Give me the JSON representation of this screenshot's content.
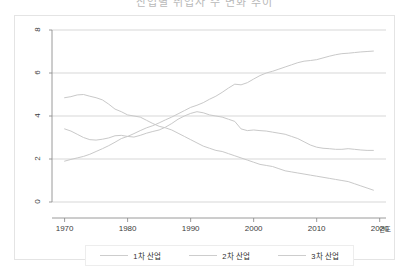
{
  "title": {
    "text": "산업별 취업자 수 변화 추이"
  },
  "axis": {
    "x_title": "연도",
    "x_ticks": [
      "1970",
      "1980",
      "1990",
      "2000",
      "2010",
      "2020"
    ],
    "y_ticks": [
      "0",
      "2",
      "4",
      "6",
      "8"
    ]
  },
  "legend": {
    "items": [
      {
        "label": "1차 산업",
        "color": "#cdcdcd"
      },
      {
        "label": "2차 산업",
        "color": "#cdcdcd"
      },
      {
        "label": "3차 산업",
        "color": "#cdcdcd"
      }
    ]
  },
  "colors": {
    "line": "#c9c9c9",
    "grid": "#d2d2d2",
    "axis": "#8f8f8f",
    "frame": "#e4e4e4",
    "text": "#3c3c3c"
  },
  "chart_data": {
    "type": "line",
    "title": "산업별 취업자 수 변화 추이",
    "xlabel": "연도",
    "ylabel": "",
    "xlim": [
      1968,
      2021
    ],
    "ylim": [
      0,
      8
    ],
    "grid": true,
    "legend_position": "bottom",
    "x": [
      1970,
      1971,
      1972,
      1973,
      1974,
      1975,
      1976,
      1977,
      1978,
      1979,
      1980,
      1981,
      1982,
      1983,
      1984,
      1985,
      1986,
      1987,
      1988,
      1989,
      1990,
      1991,
      1992,
      1993,
      1994,
      1995,
      1996,
      1997,
      1998,
      1999,
      2000,
      2001,
      2002,
      2003,
      2004,
      2005,
      2006,
      2007,
      2008,
      2009,
      2010,
      2011,
      2012,
      2013,
      2014,
      2015,
      2016,
      2017,
      2018,
      2019
    ],
    "series": [
      {
        "name": "1차 산업",
        "values": [
          4.85,
          4.9,
          4.98,
          5.0,
          4.92,
          4.85,
          4.75,
          4.55,
          4.32,
          4.2,
          4.05,
          4.0,
          3.95,
          3.8,
          3.65,
          3.52,
          3.45,
          3.35,
          3.2,
          3.05,
          2.9,
          2.75,
          2.6,
          2.5,
          2.4,
          2.35,
          2.25,
          2.15,
          2.05,
          1.95,
          1.85,
          1.75,
          1.7,
          1.65,
          1.55,
          1.45,
          1.4,
          1.35,
          1.3,
          1.25,
          1.2,
          1.15,
          1.1,
          1.05,
          1.0,
          0.95,
          0.85,
          0.75,
          0.65,
          0.55
        ]
      },
      {
        "name": "2차 산업",
        "values": [
          3.4,
          3.3,
          3.15,
          3.0,
          2.9,
          2.88,
          2.92,
          2.98,
          3.08,
          3.1,
          3.05,
          3.02,
          3.1,
          3.2,
          3.28,
          3.35,
          3.48,
          3.65,
          3.85,
          4.0,
          4.12,
          4.2,
          4.15,
          4.05,
          4.0,
          3.95,
          3.85,
          3.75,
          3.4,
          3.32,
          3.35,
          3.32,
          3.3,
          3.25,
          3.2,
          3.15,
          3.05,
          2.95,
          2.8,
          2.65,
          2.55,
          2.5,
          2.48,
          2.45,
          2.45,
          2.48,
          2.45,
          2.42,
          2.4,
          2.4
        ]
      },
      {
        "name": "3차 산업",
        "values": [
          1.9,
          1.98,
          2.05,
          2.12,
          2.22,
          2.35,
          2.48,
          2.62,
          2.78,
          2.95,
          3.05,
          3.18,
          3.32,
          3.45,
          3.55,
          3.68,
          3.82,
          3.95,
          4.1,
          4.25,
          4.4,
          4.5,
          4.62,
          4.78,
          4.92,
          5.1,
          5.3,
          5.48,
          5.45,
          5.55,
          5.72,
          5.88,
          6.0,
          6.08,
          6.18,
          6.28,
          6.38,
          6.48,
          6.55,
          6.58,
          6.62,
          6.7,
          6.78,
          6.85,
          6.9,
          6.92,
          6.95,
          6.98,
          7.0,
          7.02
        ]
      }
    ]
  }
}
